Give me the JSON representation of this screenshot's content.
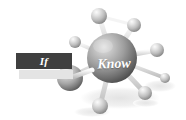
{
  "image": {
    "width": 186,
    "height": 120,
    "background_color": "#ffffff",
    "style": "grayscale 3d rendered molecule diagram"
  },
  "labels": {
    "if_text": "If",
    "know_text": "Know"
  },
  "if_bar": {
    "fill_color": "#3f3f3f",
    "shadow_color": "#e4e4e4",
    "text_color": "#ffffff"
  },
  "graphic": {
    "name": "molecule-network",
    "central_sphere": {
      "name": "Know",
      "cx": 112,
      "cy": 58,
      "r": 25,
      "highlight_color": "#d8d8d8",
      "mid_color": "#9a9a9a",
      "shadow_color": "#4e4e4e"
    },
    "secondary_sphere": {
      "name": "unlabeled-large-node",
      "cx": 70,
      "cy": 78,
      "r": 13,
      "highlight_color": "#e6e6e6",
      "mid_color": "#a8a8a8",
      "shadow_color": "#5a5a5a"
    },
    "satellite_spheres": [
      {
        "id": "node-top",
        "cx": 99,
        "cy": 16,
        "r": 8
      },
      {
        "id": "node-top-right",
        "cx": 134,
        "cy": 25,
        "r": 7
      },
      {
        "id": "node-upper-left",
        "cx": 75,
        "cy": 42,
        "r": 6
      },
      {
        "id": "node-right",
        "cx": 157,
        "cy": 50,
        "r": 7
      },
      {
        "id": "node-lower-right",
        "cx": 145,
        "cy": 93,
        "r": 7
      },
      {
        "id": "node-bottom",
        "cx": 100,
        "cy": 106,
        "r": 8
      },
      {
        "id": "node-far-right",
        "cx": 165,
        "cy": 78,
        "r": 5
      }
    ],
    "bond_color_light": "#e9e9e9",
    "bond_color_dark": "#b4b4b4",
    "ground_shadow_color": "#ededed"
  }
}
